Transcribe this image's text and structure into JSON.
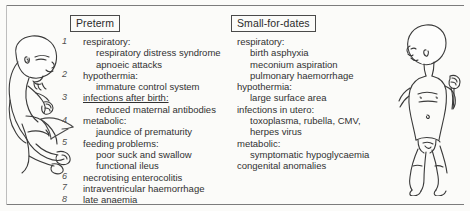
{
  "figure": {
    "background_color": "#fbfbf9",
    "ink_color": "#313131",
    "left_figure_name": "preterm-infant-illustration",
    "right_figure_name": "small-for-dates-infant-illustration",
    "annotation_arrow": "hand-drawn arrow pointing to feeding problems"
  },
  "columns": [
    {
      "heading": "Preterm",
      "numbered": true,
      "entries": [
        {
          "num": "1",
          "label": "respiratory:",
          "sub": [
            "respiratory distress syndrome",
            "apnoeic attacks"
          ]
        },
        {
          "num": "2",
          "label": "hypothermia:",
          "sub": [
            "immature control system"
          ]
        },
        {
          "num": "3",
          "label": "infections after birth:",
          "underline": true,
          "sub": [
            "reduced maternal antibodies"
          ]
        },
        {
          "num": "4",
          "label": "metabolic:",
          "sub": [
            "jaundice of prematurity"
          ]
        },
        {
          "num": "5",
          "label": "feeding problems:",
          "sub": [
            "poor suck and swallow",
            "functional ileus"
          ]
        },
        {
          "num": "6",
          "label": "necrotising enterocolitis",
          "sub": []
        },
        {
          "num": "7",
          "label": "intraventricular haemorrhage",
          "sub": []
        },
        {
          "num": "8",
          "label": "late anaemia",
          "sub": []
        }
      ]
    },
    {
      "heading": "Small-for-dates",
      "numbered": false,
      "entries": [
        {
          "num": "",
          "label": "respiratory:",
          "sub": [
            "birth asphyxia",
            "meconium aspiration",
            "pulmonary haemorrhage"
          ]
        },
        {
          "num": "",
          "label": "hypothermia:",
          "sub": [
            "large surface area"
          ]
        },
        {
          "num": "",
          "label": "infections in utero:",
          "sub": [
            "toxoplasma, rubella, CMV,",
            "herpes virus"
          ]
        },
        {
          "num": "",
          "label": "metabolic:",
          "sub": [
            "symptomatic hypoglycaemia"
          ]
        },
        {
          "num": "",
          "label": "congenital anomalies",
          "sub": []
        }
      ]
    }
  ]
}
